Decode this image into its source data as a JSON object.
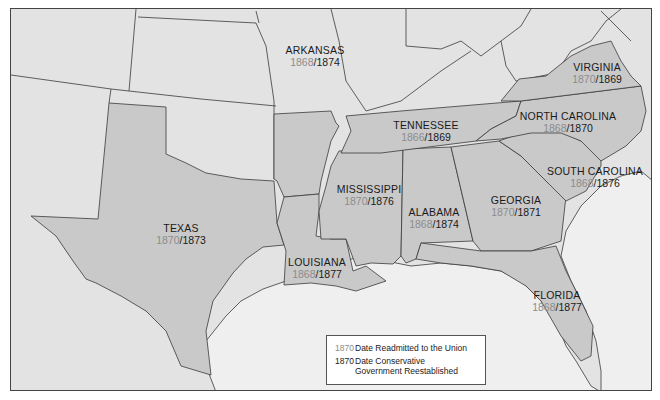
{
  "map": {
    "colors": {
      "confederate_state_fill": "#c9c9c9",
      "other_land_fill": "#e3e3e3",
      "water_fill": "#efefef",
      "border": "#3a3a3a",
      "readmission_text": "#8c8c8c",
      "conservative_text": "#1a1a1a"
    },
    "states": [
      {
        "name": "TEXAS",
        "readmitted": "1870",
        "conservative": "1873"
      },
      {
        "name": "ARKANSAS",
        "readmitted": "1868",
        "conservative": "1874"
      },
      {
        "name": "LOUISIANA",
        "readmitted": "1868",
        "conservative": "1877"
      },
      {
        "name": "MISSISSIPPI",
        "readmitted": "1870",
        "conservative": "1876"
      },
      {
        "name": "ALABAMA",
        "readmitted": "1868",
        "conservative": "1874"
      },
      {
        "name": "TENNESSEE",
        "readmitted": "1866",
        "conservative": "1869"
      },
      {
        "name": "GEORGIA",
        "readmitted": "1870",
        "conservative": "1871"
      },
      {
        "name": "FLORIDA",
        "readmitted": "1868",
        "conservative": "1877"
      },
      {
        "name": "SOUTH CAROLINA",
        "readmitted": "1868",
        "conservative": "1876"
      },
      {
        "name": "NORTH CAROLINA",
        "readmitted": "1868",
        "conservative": "1870"
      },
      {
        "name": "VIRGINIA",
        "readmitted": "1870",
        "conservative": "1869"
      }
    ],
    "legend": {
      "items": [
        {
          "year": "1870",
          "style": "gray",
          "text": "Date Readmitted to the Union"
        },
        {
          "year": "1870",
          "style": "black",
          "text_line1": "Date Conservative",
          "text_line2": "Government Reestablished"
        }
      ]
    }
  }
}
